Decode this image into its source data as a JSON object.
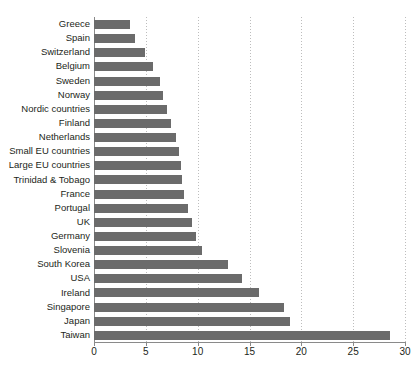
{
  "chart_data": {
    "type": "bar",
    "orientation": "horizontal",
    "title": "",
    "subtitle": "",
    "xlabel": "",
    "ylabel": "",
    "xlim": [
      0,
      30
    ],
    "xticks": [
      0,
      5,
      10,
      15,
      20,
      25,
      30
    ],
    "xtick_labels": [
      "0",
      "5",
      "10",
      "15",
      "20",
      "25",
      "30"
    ],
    "grid": true,
    "grid_axis": "x",
    "grid_style": "dotted",
    "legend": false,
    "bar_color": "#6b6b6b",
    "axis_color": "#8a8a8a",
    "grid_color": "#bdbdbd",
    "text_color": "#231f20",
    "categories": [
      "Greece",
      "Spain",
      "Switzerland",
      "Belgium",
      "Sweden",
      "Norway",
      "Nordic countries",
      "Finland",
      "Netherlands",
      "Small EU countries",
      "Large EU countries",
      "Trinidad & Tobago",
      "France",
      "Portugal",
      "UK",
      "Germany",
      "Slovenia",
      "South Korea",
      "USA",
      "Ireland",
      "Singapore",
      "Japan",
      "Taiwan"
    ],
    "values": [
      3.5,
      4.0,
      4.9,
      5.7,
      6.4,
      6.7,
      7.0,
      7.4,
      7.9,
      8.2,
      8.4,
      8.5,
      8.7,
      9.1,
      9.5,
      9.8,
      10.4,
      12.9,
      14.3,
      15.9,
      18.3,
      18.9,
      28.6
    ]
  }
}
